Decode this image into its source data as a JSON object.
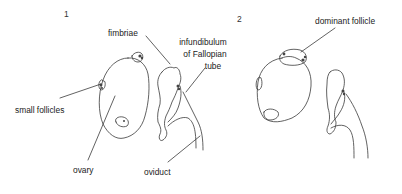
{
  "figure": {
    "panels": [
      {
        "number": "1",
        "labels": {
          "fimbriae": "fimbriae",
          "infundibulum_line1": "infundibulum",
          "infundibulum_line2": "of Fallopian",
          "infundibulum_line3": "tube",
          "small_follicles": "small follicles",
          "ovary": "ovary",
          "oviduct": "oviduct"
        }
      },
      {
        "number": "2",
        "labels": {
          "dominant_follicle": "dominant follicle"
        }
      }
    ],
    "colors": {
      "line": "#333333",
      "text": "#222222",
      "background": "#ffffff"
    }
  }
}
